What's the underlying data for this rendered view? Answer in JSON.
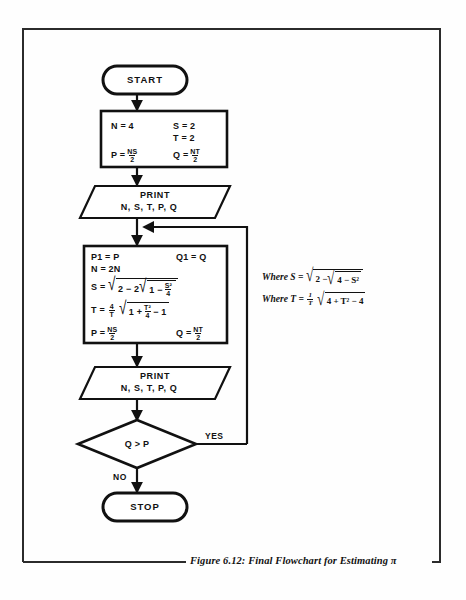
{
  "figure": {
    "caption": "Figure 6.12: Final Flowchart for Estimating π",
    "frame_color": "#2b2b2b"
  },
  "flowchart": {
    "title": "Final Flowchart for Estimating pi",
    "nodes": [
      {
        "id": "start",
        "type": "terminator",
        "label": "START"
      },
      {
        "id": "init",
        "type": "process",
        "lines": [
          {
            "left": "N = 4",
            "right": "S = 2"
          },
          {
            "left": "",
            "right": "T = 2"
          },
          {
            "left": "P = NS/2",
            "right": "Q = NT/2"
          }
        ],
        "cells": {
          "n": "N = 4",
          "s": "S = 2",
          "t": "T = 2",
          "p_lhs": "P =",
          "p_num": "NS",
          "p_den": "2",
          "q_lhs": "Q =",
          "q_num": "NT",
          "q_den": "2"
        }
      },
      {
        "id": "print1",
        "type": "io",
        "label_line1": "PRINT",
        "label_line2": "N, S, T, P, Q"
      },
      {
        "id": "compute",
        "type": "process",
        "cells": {
          "p1": "P1 = P",
          "q1": "Q1 = Q",
          "n2": "N = 2N",
          "s_lhs": "S =",
          "s_outer": "2 − 2",
          "s_inner_a": "1 −",
          "s_inner_num": "S²",
          "s_inner_den": "4",
          "t_lhs": "T =",
          "t_coef_num": "4",
          "t_coef_den": "T",
          "t_inner_a": "1 +",
          "t_inner_num": "T²",
          "t_inner_den": "4",
          "t_inner_b": "− 1",
          "p_lhs": "P =",
          "p_num": "NS",
          "p_den": "2",
          "q_lhs": "Q =",
          "q_num": "NT",
          "q_den": "2"
        }
      },
      {
        "id": "print2",
        "type": "io",
        "label_line1": "PRINT",
        "label_line2": "N, S, T, P, Q"
      },
      {
        "id": "decision",
        "type": "decision",
        "label": "Q > P",
        "yes_label": "YES",
        "no_label": "NO"
      },
      {
        "id": "stop",
        "type": "terminator",
        "label": "STOP"
      }
    ],
    "edges": [
      {
        "from": "start",
        "to": "init"
      },
      {
        "from": "init",
        "to": "print1"
      },
      {
        "from": "print1",
        "to": "compute"
      },
      {
        "from": "compute",
        "to": "print2"
      },
      {
        "from": "print2",
        "to": "decision"
      },
      {
        "from": "decision",
        "to": "compute",
        "label": "YES",
        "kind": "feedback-loop"
      },
      {
        "from": "decision",
        "to": "stop",
        "label": "NO"
      }
    ]
  },
  "annotations": {
    "where_s": {
      "prefix": "Where S  =",
      "outer": "2 −",
      "inner": "4 − S²"
    },
    "where_t": {
      "prefix": "Where T  =",
      "coef_num": "1",
      "coef_den": "T",
      "inner": "4 + T² − 4"
    }
  }
}
